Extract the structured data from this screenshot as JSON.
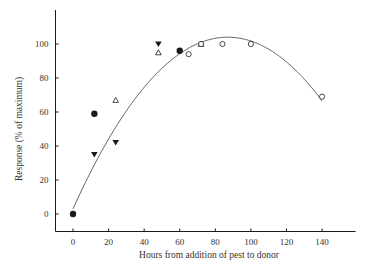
{
  "chart_data": {
    "type": "scatter",
    "title": "",
    "xlabel": "Hours from addition of pest to donor",
    "ylabel": "Response (% of maximum)",
    "xlim": [
      -10,
      160
    ],
    "ylim": [
      -10,
      120
    ],
    "xticks": [
      0,
      20,
      40,
      60,
      80,
      100,
      120,
      140
    ],
    "yticks": [
      0,
      20,
      40,
      60,
      80,
      100
    ],
    "grid": false,
    "legend": null,
    "series": [
      {
        "name": "filled-circle",
        "marker": "circle-filled",
        "points": [
          [
            0,
            0
          ],
          [
            12,
            59
          ],
          [
            60,
            96
          ]
        ]
      },
      {
        "name": "filled-down-triangle",
        "marker": "triangle-down-filled",
        "points": [
          [
            12,
            35
          ],
          [
            24,
            42
          ],
          [
            48,
            100
          ]
        ]
      },
      {
        "name": "open-triangle",
        "marker": "triangle-up-open",
        "points": [
          [
            24,
            67
          ],
          [
            48,
            95
          ],
          [
            72,
            100
          ]
        ]
      },
      {
        "name": "open-circle",
        "marker": "circle-open",
        "points": [
          [
            65,
            94
          ],
          [
            72,
            100
          ],
          [
            84,
            100
          ],
          [
            100,
            100
          ],
          [
            140,
            69
          ]
        ]
      }
    ],
    "fit_curve": {
      "type": "quadratic",
      "description": "Fitted curve rising from origin, peaking near 87 h at ~104%, declining to ~67% at 140 h",
      "vertex": [
        87,
        104
      ],
      "a": -0.01334,
      "x_range": [
        0,
        140
      ]
    }
  },
  "colors": {
    "ink": "#1a1a1a",
    "curve": "#555555",
    "text": "#333333"
  }
}
